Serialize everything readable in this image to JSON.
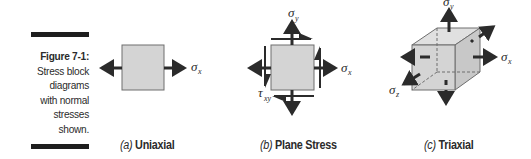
{
  "caption": {
    "number": "Figure 7-1:",
    "text": [
      "Stress block",
      "diagrams",
      "with normal",
      "stresses",
      "shown."
    ]
  },
  "panels": [
    {
      "tag": "(a)",
      "title": "Uniaxial",
      "symbols": [
        "σx"
      ]
    },
    {
      "tag": "(b)",
      "title": "Plane Stress",
      "symbols": [
        "σy",
        "σx",
        "τxy"
      ]
    },
    {
      "tag": "(c)",
      "title": "Triaxial",
      "symbols": [
        "σy",
        "σx",
        "σz"
      ]
    }
  ],
  "colors": {
    "block_fill": "#d4d4d4",
    "block_edge": "#6e6e6e",
    "arrow": "#2b2b2b",
    "rule": "#1e1e1e"
  }
}
